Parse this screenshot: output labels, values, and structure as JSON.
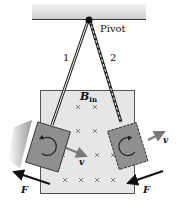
{
  "diagram": {
    "type": "physics-pendulum-eddy-current",
    "labels": {
      "pivot": "Pivot",
      "rod1": "1",
      "rod2": "2",
      "field": "B",
      "field_sub": "in",
      "velocity_left": "v",
      "velocity_right": "v",
      "force_left": "F",
      "force_right": "F"
    },
    "field_marks": [
      {
        "x": 78,
        "y": 107
      },
      {
        "x": 95,
        "y": 107
      },
      {
        "x": 78,
        "y": 131
      },
      {
        "x": 95,
        "y": 131
      },
      {
        "x": 63,
        "y": 155
      },
      {
        "x": 97,
        "y": 155
      },
      {
        "x": 113,
        "y": 155
      },
      {
        "x": 65,
        "y": 180
      },
      {
        "x": 81,
        "y": 180
      },
      {
        "x": 97,
        "y": 180
      },
      {
        "x": 113,
        "y": 180
      }
    ],
    "colors": {
      "ceiling": "#d9d9d9",
      "field_region": "#e6e6e6",
      "plate": "#8f8f8f",
      "arrow_v": "#7a7a7a",
      "arrow_f": "#111111"
    }
  }
}
